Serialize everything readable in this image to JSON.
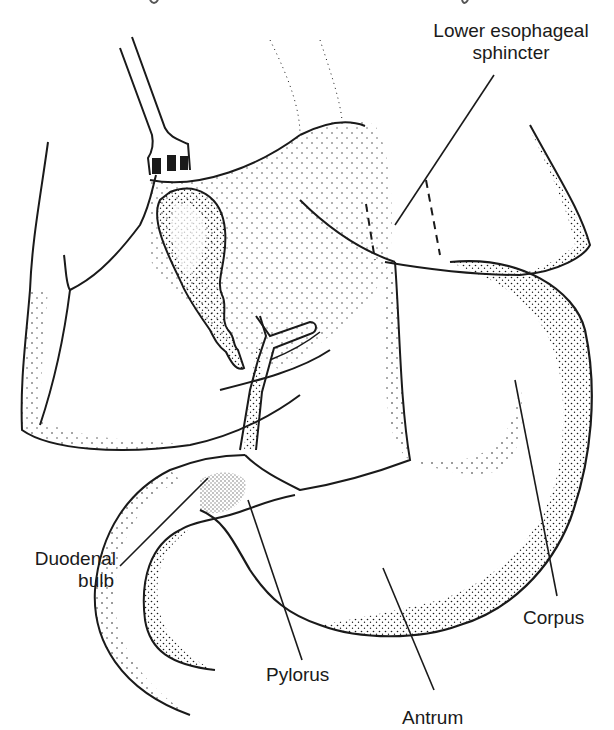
{
  "figure": {
    "caption_fragment": "...g... ...y",
    "labels": {
      "lower_esophageal_sphincter": {
        "line1": "Lower esophageal",
        "line2": "sphincter"
      },
      "duodenal_bulb": {
        "line1": "Duodenal",
        "line2": "bulb"
      },
      "pylorus": "Pylorus",
      "antrum": "Antrum",
      "corpus": "Corpus"
    },
    "colors": {
      "ink": "#1a1a1a",
      "background": "#ffffff"
    }
  }
}
